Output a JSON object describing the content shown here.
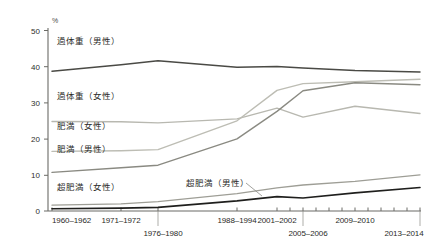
{
  "chart_data": {
    "type": "line",
    "title": "",
    "xlabel": "",
    "ylabel": "",
    "unit_label": "%",
    "ylim": [
      0,
      50
    ],
    "yticks": [
      0,
      10,
      20,
      30,
      40,
      50
    ],
    "grid": false,
    "legend_position": "inline-labels",
    "categories": [
      "1960–1962",
      "1971–1972",
      "1976–1980",
      "1988–1994",
      "2001–2002",
      "2005–2006",
      "2009–2010",
      "2013–2014"
    ],
    "series": [
      {
        "name": "過体重（男性）",
        "color": "#4a4a45",
        "values": [
          38.7,
          40.5,
          41.6,
          39.8,
          40.0,
          39.6,
          38.9,
          38.5
        ]
      },
      {
        "name": "過体重（女性）",
        "color": "#b8b8b0",
        "values": [
          24.8,
          24.7,
          24.4,
          25.5,
          28.5,
          26.0,
          29.0,
          27.0
        ]
      },
      {
        "name": "肥満（女性）",
        "color": "#bdbdb4",
        "values": [
          16.5,
          16.7,
          17.0,
          25.0,
          33.4,
          35.3,
          35.8,
          36.5
        ]
      },
      {
        "name": "肥満（男性）",
        "color": "#8a8a82",
        "values": [
          10.7,
          12.0,
          12.7,
          20.0,
          27.6,
          33.3,
          35.5,
          35.0
        ]
      },
      {
        "name": "超肥満（女性）",
        "color": "#9e9e96",
        "values": [
          1.6,
          2.0,
          2.6,
          4.8,
          6.4,
          7.2,
          8.2,
          10.0
        ]
      },
      {
        "name": "超肥満（男性）",
        "color": "#1f1f1d",
        "values": [
          0.6,
          0.8,
          1.0,
          2.8,
          4.0,
          3.6,
          5.0,
          6.5
        ]
      }
    ],
    "annotations": [
      {
        "text": "過体重（男性）",
        "series": "過体重（男性）"
      },
      {
        "text": "過体重（女性）",
        "series": "過体重（女性）"
      },
      {
        "text": "肥満（女性）",
        "series": "肥満（女性）"
      },
      {
        "text": "肥満（男性）",
        "series": "肥満（男性）"
      },
      {
        "text": "超肥満（女性）",
        "series": "超肥満（女性）"
      },
      {
        "text": "超肥満（男性）",
        "series": "超肥満（男性）"
      }
    ]
  },
  "axis": {
    "unit": "%",
    "y_labels": [
      "50",
      "40",
      "30",
      "20",
      "10",
      "0"
    ],
    "x_labels_row1": [
      "1960–1962",
      "1971–1972",
      "1988–1994",
      "2001–2002",
      "2009–2010"
    ],
    "x_labels_row2": [
      "1976–1980",
      "2005–2006",
      "2013–2014"
    ]
  },
  "labels": {
    "overweight_male": "過体重（男性）",
    "overweight_female": "過体重（女性）",
    "obese_female": "肥満（女性）",
    "obese_male": "肥満（男性）",
    "severely_obese_female": "超肥満（女性）",
    "severely_obese_male": "超肥満（男性）"
  }
}
